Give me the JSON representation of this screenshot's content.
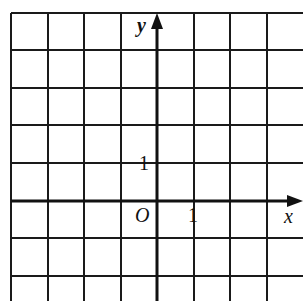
{
  "diagram": {
    "type": "coordinate-grid",
    "axes": {
      "x_label": "x",
      "y_label": "y",
      "origin_label": "O",
      "x_tick_label": "1",
      "y_tick_label": "1"
    },
    "grid": {
      "columns": 8,
      "rows": 8,
      "columns_left_of_y_axis": 4,
      "rows_above_x_axis": 5,
      "unit": 1
    },
    "colors": {
      "line": "#111111",
      "background": "#ffffff"
    }
  }
}
